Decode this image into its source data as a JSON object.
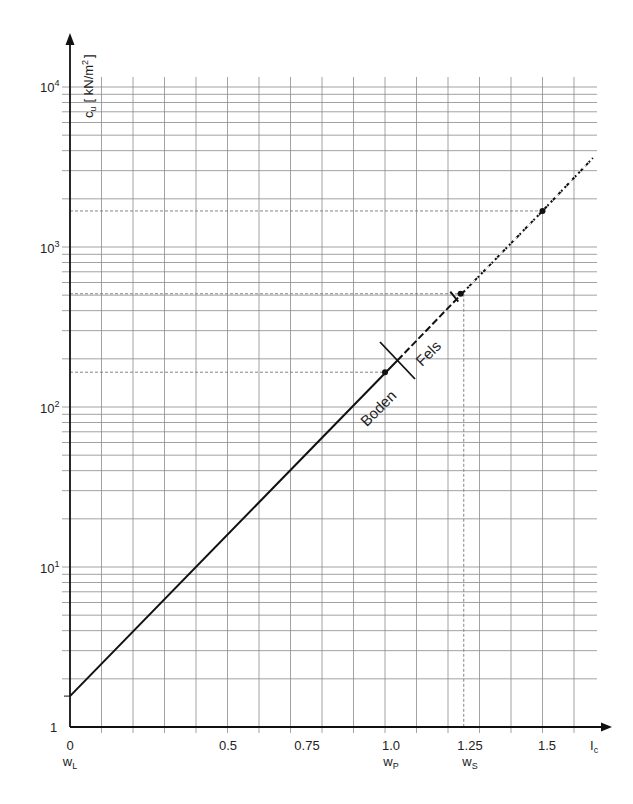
{
  "chart_data": {
    "type": "line",
    "title": "",
    "xlabel": "I_c",
    "ylabel": "c_u [kN/m²]",
    "yscale": "log",
    "xlim": [
      0,
      1.6
    ],
    "ylim": [
      1,
      10000
    ],
    "grid": true,
    "x_ticks": [
      {
        "value": 0,
        "label": "0",
        "sublabel": "w_L"
      },
      {
        "value": 0.5,
        "label": "0.5",
        "sublabel": ""
      },
      {
        "value": 0.75,
        "label": "0.75",
        "sublabel": ""
      },
      {
        "value": 1.0,
        "label": "1.0",
        "sublabel": "w_P"
      },
      {
        "value": 1.25,
        "label": "1.25",
        "sublabel": "w_S"
      },
      {
        "value": 1.5,
        "label": "1.5",
        "sublabel": ""
      }
    ],
    "y_ticks": [
      {
        "value": 1,
        "label": "1"
      },
      {
        "value": 10,
        "label": "10",
        "exp": "1"
      },
      {
        "value": 100,
        "label": "10",
        "exp": "2"
      },
      {
        "value": 1000,
        "label": "10",
        "exp": "3"
      },
      {
        "value": 10000,
        "label": "10",
        "exp": "4"
      }
    ],
    "series": [
      {
        "name": "c_u(I_c) Boden",
        "style": "solid",
        "x": [
          0,
          1.04
        ],
        "y": [
          1.56,
          196
        ]
      },
      {
        "name": "c_u(I_c) Fels",
        "style": "dashed",
        "x": [
          1.04,
          1.25,
          1.5,
          1.66
        ],
        "y": [
          196,
          525,
          1680,
          3600
        ]
      }
    ],
    "points": [
      {
        "label": "w_P",
        "x": 1.0,
        "y": 165
      },
      {
        "label": "w_S",
        "x": 1.24,
        "y": 510
      },
      {
        "label": "",
        "x": 1.5,
        "y": 1680
      }
    ],
    "annotations": [
      {
        "text": "Boden",
        "x": 1.0,
        "y": 120,
        "rotation": -45
      },
      {
        "text": "Fels",
        "x": 1.15,
        "y": 240,
        "rotation": -45
      }
    ],
    "boundary": {
      "x": 1.04,
      "y": 196,
      "description": "Boden / Fels transition"
    }
  },
  "labels": {
    "y_axis_symbol": "c",
    "y_axis_sub": "u",
    "y_axis_unit": "[ kN/m",
    "y_axis_unit_sup": "2",
    "y_axis_unit_close": "]",
    "x_axis_symbol": "I",
    "x_axis_sub": "c",
    "boden": "Boden",
    "fels": "Fels",
    "ytick_1": "1",
    "ytick_10": "10",
    "exp_1": "1",
    "exp_2": "2",
    "exp_3": "3",
    "exp_4": "4",
    "xtick_0": "0",
    "xtick_05": "0.5",
    "xtick_075": "0.75",
    "xtick_10": "1.0",
    "xtick_125": "1.25",
    "xtick_15": "1.5",
    "w": "w",
    "sub_L": "L",
    "sub_P": "P",
    "sub_S": "S"
  }
}
